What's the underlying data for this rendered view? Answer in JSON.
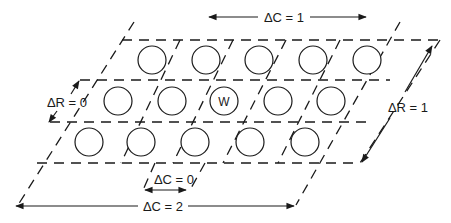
{
  "diagram": {
    "labels": {
      "dc_top": "ΔC = 1",
      "dc_bottom": "ΔC = 2",
      "dc_small": "ΔC = 0",
      "dr_left": "ΔR = 0",
      "dr_right": "ΔR = 1",
      "center_cell": "W"
    },
    "rows": [
      {
        "y": 60,
        "cells": [
          152,
          206,
          259,
          313,
          367
        ]
      },
      {
        "y": 101,
        "cells": [
          118,
          172,
          224,
          278,
          331
        ]
      },
      {
        "y": 142,
        "cells": [
          89,
          141,
          195,
          250,
          305
        ]
      }
    ],
    "center_cell_index": {
      "row": 1,
      "col": 2
    },
    "colors": {
      "line": "#1a1a1a",
      "background": "#ffffff"
    }
  }
}
